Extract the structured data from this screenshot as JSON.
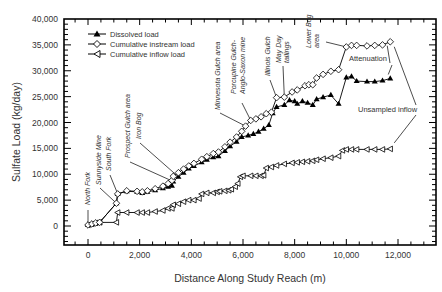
{
  "chart_data": {
    "type": "line",
    "title": "",
    "xlabel": "Distance Along Study Reach (m)",
    "ylabel": "Sulfate Load (kg/day)",
    "xlim": [
      -800,
      13600
    ],
    "ylim": [
      -3500,
      40000
    ],
    "x_ticks": [
      0,
      2000,
      4000,
      6000,
      8000,
      10000,
      12000
    ],
    "x_tick_labels": [
      "0",
      "2,000",
      "4,000",
      "6,000",
      "8,000",
      "10,000",
      "12,000"
    ],
    "y_ticks": [
      0,
      5000,
      10000,
      15000,
      20000,
      25000,
      30000,
      35000,
      40000
    ],
    "y_tick_labels": [
      "0",
      "5,000",
      "10,000",
      "15,000",
      "20,000",
      "25,000",
      "30,000",
      "35,000",
      "40,000"
    ],
    "grid": false,
    "legend_position": "top-left",
    "series": [
      {
        "name": "Dissolved load",
        "marker": "filled-triangle-up",
        "points": [
          [
            0,
            200
          ],
          [
            150,
            400
          ],
          [
            300,
            600
          ],
          [
            450,
            700
          ],
          [
            1100,
            4400
          ],
          [
            1150,
            6200
          ],
          [
            1500,
            6700
          ],
          [
            1900,
            6600
          ],
          [
            2100,
            6400
          ],
          [
            2300,
            6600
          ],
          [
            2600,
            6900
          ],
          [
            2900,
            7300
          ],
          [
            3100,
            7600
          ],
          [
            3250,
            7800
          ],
          [
            3300,
            8600
          ],
          [
            3500,
            9500
          ],
          [
            3700,
            10300
          ],
          [
            3900,
            11100
          ],
          [
            4100,
            11600
          ],
          [
            4400,
            12300
          ],
          [
            4600,
            12800
          ],
          [
            4850,
            13300
          ],
          [
            5050,
            13500
          ],
          [
            5300,
            14500
          ],
          [
            5500,
            15400
          ],
          [
            5750,
            16300
          ],
          [
            5950,
            17200
          ],
          [
            6200,
            17500
          ],
          [
            6400,
            17800
          ],
          [
            6600,
            18200
          ],
          [
            6800,
            18800
          ],
          [
            7000,
            19500
          ],
          [
            7150,
            21800
          ],
          [
            7300,
            23000
          ],
          [
            7600,
            23400
          ],
          [
            7800,
            24300
          ],
          [
            8000,
            24100
          ],
          [
            8100,
            23600
          ],
          [
            8300,
            24100
          ],
          [
            8500,
            23800
          ],
          [
            8700,
            23400
          ],
          [
            8850,
            24500
          ],
          [
            9100,
            24900
          ],
          [
            9400,
            25300
          ],
          [
            9700,
            23600
          ],
          [
            10000,
            28700
          ],
          [
            10200,
            28900
          ],
          [
            10400,
            28000
          ],
          [
            10800,
            27900
          ],
          [
            11100,
            27900
          ],
          [
            11400,
            28100
          ],
          [
            11700,
            28500
          ]
        ]
      },
      {
        "name": "Cumulative instream load",
        "marker": "open-diamond",
        "points": [
          [
            0,
            200
          ],
          [
            150,
            400
          ],
          [
            300,
            600
          ],
          [
            450,
            700
          ],
          [
            1100,
            4400
          ],
          [
            1150,
            6200
          ],
          [
            1500,
            6800
          ],
          [
            1900,
            6700
          ],
          [
            2100,
            6600
          ],
          [
            2300,
            6800
          ],
          [
            2600,
            7200
          ],
          [
            2900,
            7700
          ],
          [
            3100,
            8200
          ],
          [
            3250,
            8800
          ],
          [
            3300,
            9600
          ],
          [
            3500,
            10300
          ],
          [
            3700,
            11000
          ],
          [
            3900,
            11600
          ],
          [
            4100,
            12100
          ],
          [
            4400,
            12900
          ],
          [
            4600,
            13400
          ],
          [
            4850,
            14000
          ],
          [
            5050,
            14300
          ],
          [
            5300,
            15300
          ],
          [
            5500,
            16200
          ],
          [
            5750,
            17200
          ],
          [
            5950,
            18300
          ],
          [
            6100,
            19300
          ],
          [
            6300,
            20400
          ],
          [
            6500,
            20700
          ],
          [
            6700,
            21100
          ],
          [
            6900,
            21700
          ],
          [
            7100,
            22000
          ],
          [
            7300,
            24800
          ],
          [
            7600,
            24900
          ],
          [
            7900,
            25900
          ],
          [
            8100,
            26300
          ],
          [
            8400,
            27100
          ],
          [
            8550,
            27300
          ],
          [
            8700,
            27300
          ],
          [
            8850,
            28600
          ],
          [
            9100,
            29300
          ],
          [
            9400,
            29900
          ],
          [
            9700,
            30200
          ],
          [
            10000,
            34600
          ],
          [
            10200,
            34900
          ],
          [
            10400,
            34900
          ],
          [
            10800,
            34800
          ],
          [
            11100,
            34900
          ],
          [
            11400,
            35000
          ],
          [
            11700,
            35600
          ]
        ]
      },
      {
        "name": "Cumulative inflow load",
        "marker": "open-triangle-left",
        "points": [
          [
            0,
            200
          ],
          [
            150,
            400
          ],
          [
            300,
            600
          ],
          [
            450,
            700
          ],
          [
            1100,
            700
          ],
          [
            1150,
            2600
          ],
          [
            1500,
            2600
          ],
          [
            1900,
            2600
          ],
          [
            2100,
            2600
          ],
          [
            2300,
            2600
          ],
          [
            2600,
            2800
          ],
          [
            2900,
            3000
          ],
          [
            3100,
            3400
          ],
          [
            3250,
            3400
          ],
          [
            3300,
            4100
          ],
          [
            3500,
            4300
          ],
          [
            3700,
            4700
          ],
          [
            3900,
            5000
          ],
          [
            4100,
            5000
          ],
          [
            4300,
            5300
          ],
          [
            4400,
            6200
          ],
          [
            4600,
            6400
          ],
          [
            4850,
            6400
          ],
          [
            5000,
            6600
          ],
          [
            5100,
            6700
          ],
          [
            5300,
            6800
          ],
          [
            5450,
            6900
          ],
          [
            5550,
            7100
          ],
          [
            5700,
            7600
          ],
          [
            5800,
            8200
          ],
          [
            5900,
            9500
          ],
          [
            6000,
            9700
          ],
          [
            6300,
            9700
          ],
          [
            6500,
            9700
          ],
          [
            6700,
            9700
          ],
          [
            6800,
            9800
          ],
          [
            6900,
            11200
          ],
          [
            7100,
            11400
          ],
          [
            7300,
            11700
          ],
          [
            7600,
            12000
          ],
          [
            7900,
            12200
          ],
          [
            8100,
            12300
          ],
          [
            8300,
            12400
          ],
          [
            8500,
            12500
          ],
          [
            8700,
            12600
          ],
          [
            8850,
            12800
          ],
          [
            9100,
            13000
          ],
          [
            9400,
            13200
          ],
          [
            9700,
            13500
          ],
          [
            9850,
            14600
          ],
          [
            10000,
            14800
          ],
          [
            10200,
            14800
          ],
          [
            10400,
            14800
          ],
          [
            10800,
            14800
          ],
          [
            11100,
            14800
          ],
          [
            11400,
            14800
          ],
          [
            11700,
            14900
          ]
        ]
      }
    ],
    "annotations": [
      {
        "text": "North Fork",
        "style": "italic",
        "x": 0,
        "y": 200
      },
      {
        "text": "Sunnyside Mine",
        "style": "italic",
        "x": 1100,
        "y": 4400
      },
      {
        "text": "South Fork",
        "style": "italic",
        "x": 1150,
        "y": 6200
      },
      {
        "text": "Prospect Gulch area",
        "style": "italic",
        "x": 3300,
        "y": 8600
      },
      {
        "text": "Iron Bog",
        "style": "italic",
        "x": 3500,
        "y": 9500
      },
      {
        "text": "Minnesota Gulch area",
        "style": "italic",
        "x": 6100,
        "y": 19300
      },
      {
        "text": "Porcupine Gulch-",
        "style": "italic",
        "x": 6300,
        "y": 20400
      },
      {
        "text": "Anglo-Saxon mine",
        "style": "italic",
        "x": 6300,
        "y": 20400
      },
      {
        "text": "Illinois Gulch",
        "style": "italic",
        "x": 7300,
        "y": 24800
      },
      {
        "text": "May Day",
        "style": "italic",
        "x": 7600,
        "y": 24900
      },
      {
        "text": "tailings",
        "style": "italic",
        "x": 7600,
        "y": 24900
      },
      {
        "text": "Lower Bog",
        "style": "italic",
        "x": 10000,
        "y": 34600
      },
      {
        "text": "area",
        "style": "italic",
        "x": 10000,
        "y": 34600
      },
      {
        "text": "Attenuation",
        "style": "normal",
        "x": 11700,
        "y": 28500
      },
      {
        "text": "Unsampled inflow",
        "style": "normal",
        "x": 11700,
        "y": 14900
      }
    ]
  }
}
